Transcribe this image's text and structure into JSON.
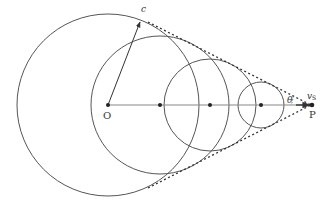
{
  "labels": {
    "origin": "O",
    "wavefront": "c",
    "angle": "θ",
    "source_velocity": "v",
    "source_velocity_sub": "S",
    "source_point": "P"
  },
  "geometry": {
    "origin": [
      108,
      105
    ],
    "source": [
      311,
      105
    ],
    "circles": [
      {
        "cx": 108,
        "cy": 105,
        "r": 91
      },
      {
        "cx": 160,
        "cy": 105,
        "r": 69
      },
      {
        "cx": 210,
        "cy": 105,
        "r": 46
      },
      {
        "cx": 261,
        "cy": 105,
        "r": 23
      }
    ]
  },
  "colors": {
    "stroke": "#555555",
    "axis": "#888888",
    "dots": "#222222"
  }
}
